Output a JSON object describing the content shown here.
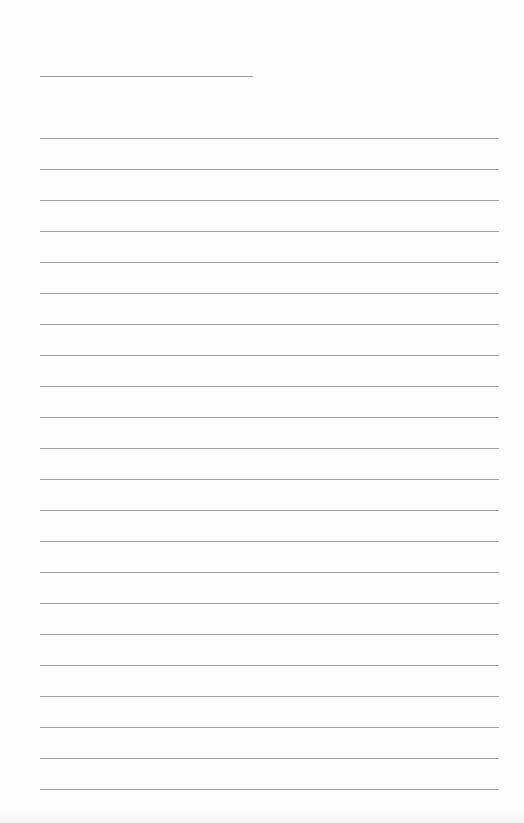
{
  "page": {
    "type": "lined-writing-sheet",
    "background_color": "#fefefe",
    "line_color": "#a0a0a0"
  },
  "title_line": {
    "x": 40,
    "y": 76,
    "width": 213,
    "text": ""
  },
  "ruled_lines": {
    "count": 22,
    "start_y": 138,
    "spacing": 31,
    "x": 40,
    "width": 459,
    "entries": [
      "",
      "",
      "",
      "",
      "",
      "",
      "",
      "",
      "",
      "",
      "",
      "",
      "",
      "",
      "",
      "",
      "",
      "",
      "",
      "",
      "",
      ""
    ]
  }
}
